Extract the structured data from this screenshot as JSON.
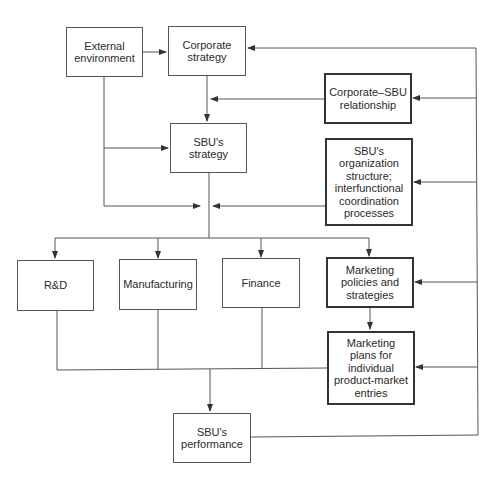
{
  "diagram": {
    "nodes": {
      "external_environment": "External\nenvironment",
      "corporate_strategy": "Corporate\nstrategy",
      "corporate_sbu_relationship": "Corporate–SBU\nrelationship",
      "sbu_strategy": "SBU's\nstrategy",
      "sbu_organization": "SBU's\norganization\nstructure;\ninterfunctional\ncoordination\nprocesses",
      "rnd": "R&D",
      "manufacturing": "Manufacturing",
      "finance": "Finance",
      "marketing_policies": "Marketing\npolicies and\nstrategies",
      "marketing_plans": "Marketing\nplans for\nindividual\nproduct-market\nentries",
      "sbu_performance": "SBU's\nperformance"
    },
    "edges": [
      {
        "from": "external_environment",
        "to": "corporate_strategy"
      },
      {
        "from": "external_environment",
        "to": "sbu_strategy"
      },
      {
        "from": "external_environment",
        "to": "functional_junction"
      },
      {
        "from": "corporate_strategy",
        "to": "sbu_strategy"
      },
      {
        "from": "corporate_sbu_relationship",
        "to": "sbu_strategy"
      },
      {
        "from": "sbu_strategy",
        "to": "functional_junction"
      },
      {
        "from": "sbu_organization",
        "to": "functional_junction"
      },
      {
        "from": "functional_junction",
        "to": "rnd"
      },
      {
        "from": "functional_junction",
        "to": "manufacturing"
      },
      {
        "from": "functional_junction",
        "to": "finance"
      },
      {
        "from": "functional_junction",
        "to": "marketing_policies"
      },
      {
        "from": "marketing_policies",
        "to": "marketing_plans"
      },
      {
        "from": "rnd",
        "to": "sbu_performance"
      },
      {
        "from": "manufacturing",
        "to": "sbu_performance"
      },
      {
        "from": "finance",
        "to": "sbu_performance"
      },
      {
        "from": "marketing_plans",
        "to": "sbu_performance"
      },
      {
        "from": "sbu_performance",
        "to": "corporate_strategy",
        "type": "feedback"
      },
      {
        "from": "sbu_performance",
        "to": "corporate_sbu_relationship",
        "type": "feedback"
      },
      {
        "from": "sbu_performance",
        "to": "sbu_organization",
        "type": "feedback"
      },
      {
        "from": "sbu_performance",
        "to": "marketing_policies",
        "type": "feedback"
      },
      {
        "from": "sbu_performance",
        "to": "marketing_plans",
        "type": "feedback"
      }
    ],
    "colors": {
      "line": "#444444",
      "text": "#2a2a2a",
      "background": "#ffffff"
    }
  }
}
